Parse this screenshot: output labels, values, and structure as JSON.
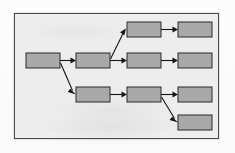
{
  "page": {
    "kind": "scanned-flow-diagram",
    "panel": {
      "x": 14,
      "y": 13,
      "width": 205,
      "height": 126
    },
    "colors": {
      "paper": "#fbfbfb",
      "panel_fill": "#ededed",
      "panel_border": "#4a4a4a",
      "node_fill": "#a9a9a9",
      "node_border": "#2b2b2b",
      "connector": "#151515"
    }
  },
  "diagram": {
    "type": "flowchart",
    "orientation": "left-to-right",
    "label": "",
    "nodes": [
      {
        "id": "n1",
        "label": "",
        "x": 11,
        "y": 39,
        "w": 34,
        "h": 15,
        "column": 1,
        "row": "middle"
      },
      {
        "id": "n2",
        "label": "",
        "x": 61,
        "y": 39,
        "w": 34,
        "h": 15,
        "column": 2,
        "row": "middle"
      },
      {
        "id": "n3",
        "label": "",
        "x": 112,
        "y": 8,
        "w": 34,
        "h": 15,
        "column": 3,
        "row": "top"
      },
      {
        "id": "n4",
        "label": "",
        "x": 112,
        "y": 39,
        "w": 34,
        "h": 15,
        "column": 3,
        "row": "middle"
      },
      {
        "id": "n5",
        "label": "",
        "x": 163,
        "y": 8,
        "w": 34,
        "h": 15,
        "column": 4,
        "row": "top"
      },
      {
        "id": "n6",
        "label": "",
        "x": 163,
        "y": 39,
        "w": 34,
        "h": 15,
        "column": 4,
        "row": "middle"
      },
      {
        "id": "n7",
        "label": "",
        "x": 61,
        "y": 73,
        "w": 34,
        "h": 15,
        "column": 2,
        "row": "lower"
      },
      {
        "id": "n8",
        "label": "",
        "x": 112,
        "y": 73,
        "w": 34,
        "h": 15,
        "column": 3,
        "row": "lower"
      },
      {
        "id": "n9",
        "label": "",
        "x": 163,
        "y": 73,
        "w": 34,
        "h": 15,
        "column": 4,
        "row": "lower"
      },
      {
        "id": "n10",
        "label": "",
        "x": 163,
        "y": 101,
        "w": 34,
        "h": 15,
        "column": 4,
        "row": "bottom"
      }
    ],
    "edges": [
      {
        "from": "n1",
        "to": "n2",
        "style": "straight-horizontal"
      },
      {
        "from": "n1",
        "to": "n7",
        "style": "diagonal-down"
      },
      {
        "from": "n2",
        "to": "n3",
        "style": "diagonal-up"
      },
      {
        "from": "n2",
        "to": "n4",
        "style": "straight-horizontal"
      },
      {
        "from": "n3",
        "to": "n5",
        "style": "straight-horizontal"
      },
      {
        "from": "n4",
        "to": "n6",
        "style": "straight-horizontal"
      },
      {
        "from": "n7",
        "to": "n8",
        "style": "straight-horizontal"
      },
      {
        "from": "n8",
        "to": "n9",
        "style": "straight-horizontal"
      },
      {
        "from": "n8",
        "to": "n10",
        "style": "diagonal-down"
      }
    ],
    "node_count": 10,
    "edge_count": 9
  }
}
